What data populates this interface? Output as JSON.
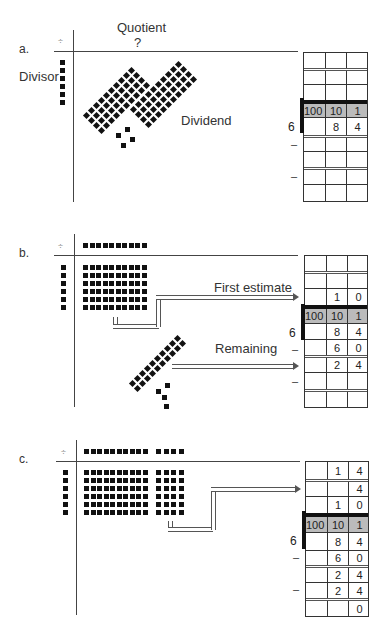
{
  "sections": {
    "a": {
      "letter": "a.",
      "quotient_label": "Quotient",
      "quotient_value": "?",
      "divisor_label": "Divisor",
      "dividend_label": "Dividend",
      "divide_symbol": "÷",
      "divisor": "6",
      "header": [
        "100",
        "10",
        "1"
      ],
      "rows": [
        [
          "",
          "",
          ""
        ],
        [
          "",
          "",
          ""
        ],
        [
          "",
          "",
          ""
        ],
        [
          "",
          "8",
          "4"
        ],
        [
          "",
          "",
          ""
        ],
        [
          "",
          "",
          ""
        ],
        [
          "",
          "",
          ""
        ],
        [
          "",
          "",
          ""
        ]
      ],
      "minus_signs": [
        "–",
        "–"
      ]
    },
    "b": {
      "letter": "b.",
      "divide_symbol": "÷",
      "first_estimate_label": "First estimate",
      "remaining_label": "Remaining",
      "divisor": "6",
      "header": [
        "100",
        "10",
        "1"
      ],
      "rows_above": [
        [
          "",
          "",
          ""
        ],
        [
          "",
          "",
          ""
        ],
        [
          "",
          "1",
          "0"
        ]
      ],
      "rows_below": [
        [
          "",
          "8",
          "4"
        ],
        [
          "",
          "6",
          "0"
        ],
        [
          "",
          "2",
          "4"
        ],
        [
          "",
          "",
          ""
        ],
        [
          "",
          "",
          ""
        ]
      ],
      "minus_signs": [
        "–",
        "–"
      ]
    },
    "c": {
      "letter": "c.",
      "divide_symbol": "÷",
      "divisor": "6",
      "header": [
        "100",
        "10",
        "1"
      ],
      "rows_above": [
        [
          "",
          "1",
          "4"
        ],
        [
          "",
          "",
          "4"
        ],
        [
          "",
          "1",
          "0"
        ]
      ],
      "rows_below": [
        [
          "",
          "8",
          "4"
        ],
        [
          "",
          "6",
          "0"
        ],
        [
          "",
          "2",
          "4"
        ],
        [
          "",
          "2",
          "4"
        ],
        [
          "",
          "",
          "0"
        ]
      ],
      "minus_signs": [
        "–",
        "–"
      ]
    }
  }
}
